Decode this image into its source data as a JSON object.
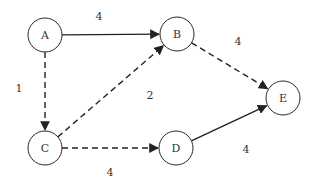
{
  "diagram": {
    "type": "directed-weighted-graph",
    "nodes": [
      {
        "id": "A",
        "label": "A",
        "x": 45,
        "y": 35
      },
      {
        "id": "B",
        "label": "B",
        "x": 177,
        "y": 34
      },
      {
        "id": "C",
        "label": "C",
        "x": 45,
        "y": 148
      },
      {
        "id": "D",
        "label": "D",
        "x": 176,
        "y": 148
      },
      {
        "id": "E",
        "label": "E",
        "x": 283,
        "y": 98
      }
    ],
    "edges": [
      {
        "from": "A",
        "to": "B",
        "weight": "4",
        "style": "solid",
        "label_x": 99,
        "label_y": 16
      },
      {
        "from": "A",
        "to": "C",
        "weight": "1",
        "style": "dashed",
        "label_x": 19,
        "label_y": 88
      },
      {
        "from": "C",
        "to": "B",
        "weight": "2",
        "style": "dashed",
        "label_x": 150,
        "label_y": 95
      },
      {
        "from": "C",
        "to": "D",
        "weight": "4",
        "style": "dashed",
        "label_x": 110,
        "label_y": 172
      },
      {
        "from": "B",
        "to": "E",
        "weight": "4",
        "style": "dashed",
        "label_x": 238,
        "label_y": 41
      },
      {
        "from": "D",
        "to": "E",
        "weight": "4",
        "style": "solid",
        "label_x": 246,
        "label_y": 149
      }
    ],
    "node_radius": 17,
    "colors": {
      "stroke": "#222222",
      "text": "#333333",
      "background": "#ffffff"
    }
  }
}
